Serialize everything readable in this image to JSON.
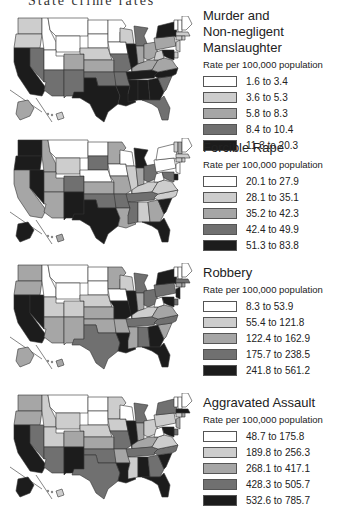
{
  "header": {
    "title": "State crime rates"
  },
  "scale_colors": [
    "#ffffff",
    "#cdcdcd",
    "#a6a6a6",
    "#707070",
    "#1c1c1c"
  ],
  "legend_subtitle": "Rate per 100,000 population",
  "chart_data": [
    {
      "type": "choropleth",
      "title": "Murder and Non-negligent Manslaughter",
      "title_lines": [
        "Murder and",
        "Non-negligent Manslaughter"
      ],
      "subtitle": "Rate per 100,000 population",
      "legend": [
        "1.6 to 3.4",
        "3.6 to 5.3",
        "5.8 to 8.3",
        "8.4 to 10.4",
        "11.3 to 20.3"
      ],
      "states": {
        "WA": 1,
        "OR": 1,
        "CA": 4,
        "NV": 3,
        "ID": 0,
        "MT": 0,
        "WY": 0,
        "UT": 0,
        "AZ": 3,
        "CO": 2,
        "NM": 3,
        "ND": 0,
        "SD": 0,
        "NE": 1,
        "KS": 2,
        "OK": 3,
        "TX": 4,
        "MN": 0,
        "IA": 0,
        "MO": 3,
        "AR": 3,
        "LA": 4,
        "WI": 1,
        "IL": 4,
        "MI": 3,
        "IN": 2,
        "OH": 2,
        "KY": 2,
        "TN": 4,
        "MS": 4,
        "AL": 4,
        "GA": 4,
        "FL": 3,
        "SC": 3,
        "NC": 4,
        "VA": 2,
        "WV": 1,
        "PA": 2,
        "NY": 4,
        "ME": 0,
        "NH": 0,
        "VT": 0,
        "MA": 1,
        "CT": 1,
        "RI": 1,
        "NJ": 1,
        "DE": 1,
        "MD": 4,
        "AK": 2,
        "HI": 1
      }
    },
    {
      "type": "choropleth",
      "title": "Forcible Rape",
      "title_lines": [
        "Forcible Rape"
      ],
      "subtitle": "Rate per 100,000 population",
      "legend": [
        "20.1 to 27.9",
        "28.1 to 35.1",
        "35.2 to 42.3",
        "42.4 to 49.9",
        "51.3 to 83.8"
      ],
      "states": {
        "WA": 4,
        "OR": 4,
        "CA": 2,
        "NV": 4,
        "ID": 2,
        "MT": 0,
        "WY": 1,
        "UT": 2,
        "AZ": 2,
        "CO": 3,
        "NM": 4,
        "ND": 0,
        "SD": 3,
        "NE": 0,
        "KS": 2,
        "OK": 3,
        "TX": 4,
        "MN": 2,
        "IA": 0,
        "MO": 2,
        "AR": 3,
        "LA": 2,
        "WI": 0,
        "IL": 1,
        "MI": 4,
        "IN": 2,
        "OH": 3,
        "KY": 1,
        "TN": 3,
        "MS": 3,
        "AL": 1,
        "GA": 2,
        "FL": 4,
        "SC": 4,
        "NC": 1,
        "VA": 1,
        "WV": 0,
        "PA": 0,
        "NY": 0,
        "ME": 0,
        "NH": 2,
        "VT": 1,
        "MA": 1,
        "CT": 1,
        "RI": 1,
        "NJ": 0,
        "DE": 4,
        "MD": 3,
        "AK": 4,
        "HI": 2
      }
    },
    {
      "type": "choropleth",
      "title": "Robbery",
      "title_lines": [
        "Robbery"
      ],
      "subtitle": "Rate per 100,000 population",
      "legend": [
        "8.3 to 53.9",
        "55.4 to 121.8",
        "122.4 to 162.9",
        "175.7 to 238.5",
        "241.8 to 561.2"
      ],
      "states": {
        "WA": 2,
        "OR": 2,
        "CA": 4,
        "NV": 4,
        "ID": 0,
        "MT": 0,
        "WY": 0,
        "UT": 1,
        "AZ": 2,
        "CO": 1,
        "NM": 2,
        "ND": 0,
        "SD": 0,
        "NE": 1,
        "KS": 2,
        "OK": 2,
        "TX": 3,
        "MN": 2,
        "IA": 0,
        "MO": 4,
        "AR": 2,
        "LA": 4,
        "WI": 1,
        "IL": 4,
        "MI": 3,
        "IN": 2,
        "OH": 3,
        "KY": 1,
        "TN": 3,
        "MS": 2,
        "AL": 3,
        "GA": 4,
        "FL": 4,
        "SC": 2,
        "NC": 3,
        "VA": 2,
        "WV": 0,
        "PA": 3,
        "NY": 4,
        "ME": 0,
        "NH": 0,
        "VT": 0,
        "MA": 3,
        "CT": 2,
        "RI": 2,
        "NJ": 4,
        "DE": 3,
        "MD": 4,
        "AK": 2,
        "HI": 2
      }
    },
    {
      "type": "choropleth",
      "title": "Aggravated Assault",
      "title_lines": [
        "Aggravated Assault"
      ],
      "subtitle": "Rate per 100,000 population",
      "legend": [
        "48.7 to 175.8",
        "189.8 to 256.3",
        "268.1 to 417.1",
        "428.3 to 505.7",
        "532.6 to 785.7"
      ],
      "states": {
        "WA": 2,
        "OR": 2,
        "CA": 4,
        "NV": 3,
        "ID": 1,
        "MT": 0,
        "WY": 1,
        "UT": 1,
        "AZ": 3,
        "CO": 2,
        "NM": 4,
        "ND": 0,
        "SD": 0,
        "NE": 1,
        "KS": 2,
        "OK": 3,
        "TX": 3,
        "MN": 1,
        "IA": 1,
        "MO": 3,
        "AR": 2,
        "LA": 4,
        "WI": 0,
        "IL": 4,
        "MI": 3,
        "IN": 2,
        "OH": 1,
        "KY": 2,
        "TN": 3,
        "MS": 1,
        "AL": 4,
        "GA": 3,
        "FL": 4,
        "SC": 4,
        "NC": 3,
        "VA": 1,
        "WV": 0,
        "PA": 1,
        "NY": 3,
        "ME": 0,
        "NH": 0,
        "VT": 0,
        "MA": 4,
        "CT": 1,
        "RI": 2,
        "NJ": 2,
        "DE": 3,
        "MD": 4,
        "AK": 4,
        "HI": 1
      }
    }
  ]
}
